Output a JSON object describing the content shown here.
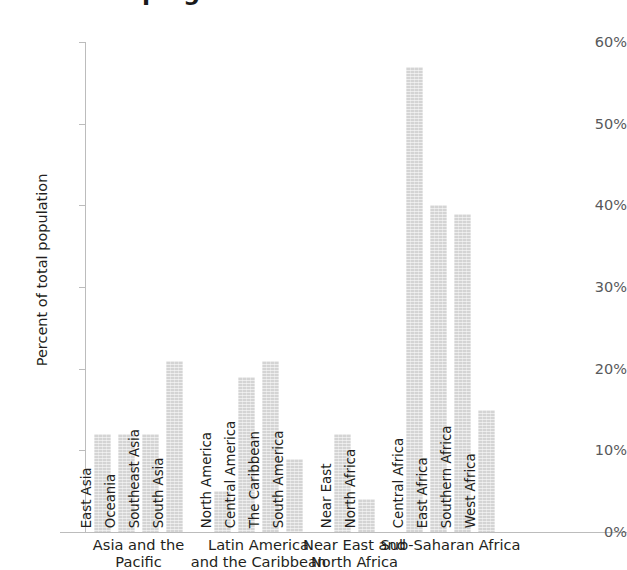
{
  "title": "the Developing World",
  "axes": {
    "y_title": "Percent of total population",
    "y_ticks": [
      "60%",
      "50%",
      "40%",
      "30%",
      "20%",
      "10%",
      "0%"
    ]
  },
  "chart_data": {
    "type": "bar",
    "title": "the Developing World",
    "xlabel": "",
    "ylabel": "Percent of total population",
    "ylim": [
      0,
      60
    ],
    "ytick_values": [
      0,
      10,
      20,
      30,
      40,
      50,
      60
    ],
    "ytick_labels": [
      "0%",
      "10%",
      "20%",
      "30%",
      "40%",
      "50%",
      "60%"
    ],
    "grid": false,
    "legend": "none",
    "units": "percent",
    "groups": [
      {
        "label": "Asia and the Pacific",
        "label_lines": [
          "Asia and the",
          "Pacific"
        ],
        "categories": [
          "East Asia",
          "Oceania",
          "Southeast Asia",
          "South Asia"
        ],
        "values": [
          12,
          12,
          12,
          21
        ]
      },
      {
        "label": "Latin America and the Caribbean",
        "label_lines": [
          "Latin America",
          "and the Caribbean"
        ],
        "categories": [
          "North America",
          "Central America",
          "The Caribbean",
          "South America"
        ],
        "values": [
          5,
          19,
          21,
          9
        ]
      },
      {
        "label": "Near East and North Africa",
        "label_lines": [
          "Near East and",
          "North Africa"
        ],
        "categories": [
          "Near East",
          "North Africa"
        ],
        "values": [
          12,
          4
        ]
      },
      {
        "label": "Sub-Saharan Africa",
        "label_lines": [
          "Sub-Saharan Africa"
        ],
        "categories": [
          "Central Africa",
          "East Africa",
          "Southern Africa",
          "West Africa"
        ],
        "values": [
          57,
          40,
          39,
          15
        ]
      }
    ],
    "categories": [
      "East Asia",
      "Oceania",
      "Southeast Asia",
      "South Asia",
      "North America",
      "Central America",
      "The Caribbean",
      "South America",
      "Near East",
      "North Africa",
      "Central Africa",
      "East Africa",
      "Southern Africa",
      "West Africa"
    ],
    "values": [
      12,
      12,
      12,
      21,
      5,
      19,
      21,
      9,
      12,
      4,
      57,
      40,
      39,
      15
    ]
  },
  "style": {
    "bar_color": "#d4d4d4",
    "axis_color": "#bcbcbc",
    "tick_label_color": "#58595b",
    "text_color": "#231f20",
    "background": "#ffffff"
  },
  "layout": {
    "bar_width": 17,
    "bar_gap": 7,
    "group_gap": 24,
    "first_bar_x": 94,
    "plot_left": 86,
    "baseline_y": 532,
    "top_y": 42,
    "px_per_percent": 8.1667
  }
}
